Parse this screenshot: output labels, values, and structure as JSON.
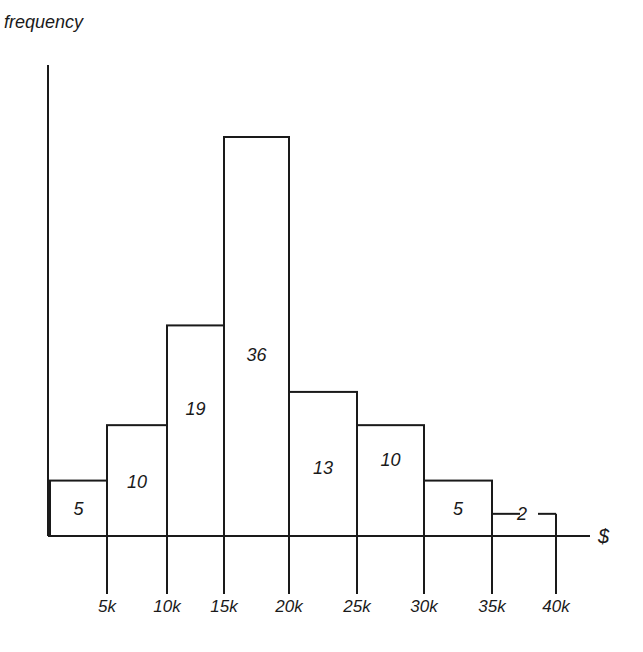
{
  "chart_data": {
    "type": "bar",
    "subtype": "histogram",
    "title": "",
    "xlabel": "$",
    "ylabel": "frequency",
    "bins": [
      {
        "from": 0,
        "to": 5000,
        "value": 5
      },
      {
        "from": 5000,
        "to": 10000,
        "value": 10
      },
      {
        "from": 10000,
        "to": 15000,
        "value": 19
      },
      {
        "from": 15000,
        "to": 20000,
        "value": 36
      },
      {
        "from": 20000,
        "to": 25000,
        "value": 13
      },
      {
        "from": 25000,
        "to": 30000,
        "value": 10
      },
      {
        "from": 30000,
        "to": 35000,
        "value": 5
      },
      {
        "from": 35000,
        "to": 40000,
        "value": 2
      }
    ],
    "categories": [
      "0-5k",
      "5k-10k",
      "10k-15k",
      "15k-20k",
      "20k-25k",
      "25k-30k",
      "30k-35k",
      "35k-40k"
    ],
    "values": [
      5,
      10,
      19,
      36,
      13,
      10,
      5,
      2
    ],
    "x_tick_labels": [
      "5k",
      "10k",
      "15k",
      "20k",
      "25k",
      "30k",
      "35k",
      "40k"
    ],
    "xlim": [
      0,
      40000
    ],
    "grid": false,
    "legend": null,
    "bar_labels_inside": true
  },
  "labels": {
    "y_axis": "frequency",
    "x_axis": "$"
  }
}
